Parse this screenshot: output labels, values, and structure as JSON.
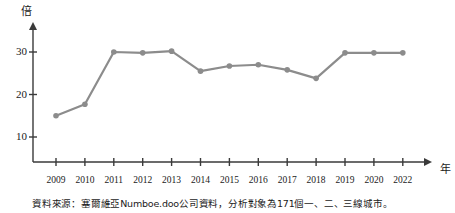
{
  "chart_data": {
    "type": "line",
    "title": "",
    "xlabel": "年",
    "ylabel": "倍",
    "categories": [
      "2009",
      "2010",
      "2011",
      "2012",
      "2013",
      "2014",
      "2015",
      "2016",
      "2017",
      "2018",
      "2019",
      "2020",
      "2022"
    ],
    "values": [
      15.0,
      17.7,
      30.0,
      29.8,
      30.2,
      25.5,
      26.7,
      27.0,
      25.8,
      23.8,
      29.8,
      29.8,
      29.8
    ],
    "ylim": [
      0,
      34
    ],
    "yticks": [
      10,
      20,
      30
    ],
    "ytick_labels": [
      "10",
      "20",
      "30"
    ],
    "grid": false,
    "legend": "none",
    "series_color": "#8c8c8c",
    "axis_color": "#3a3a3a",
    "marker": "circle",
    "note": "資料來源：塞爾維亞Numboe.doo公司資料，分析對象為171個一、二、三線城市。"
  },
  "axis": {
    "y_unit": "倍",
    "x_unit": "年"
  }
}
